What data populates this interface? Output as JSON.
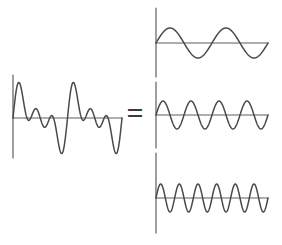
{
  "colors": {
    "background": "#ffffff",
    "wave_line": "#4a4a4a",
    "axis_line": "#5e5e5e",
    "equals": "#3c3c3c"
  },
  "equals": {
    "symbol": "="
  },
  "composite": {
    "vaxis": {
      "x1": 13,
      "y1": 75,
      "x2": 13,
      "y2": 158
    },
    "haxis": {
      "x1": 13,
      "y1": 118,
      "x2": 122,
      "y2": 118
    },
    "wave": {
      "x_start": 13,
      "x_end": 122,
      "baseline_y": 118,
      "harmonics": [
        {
          "cycles": 2,
          "amplitude_px": 15
        },
        {
          "cycles": 4,
          "amplitude_px": 14
        },
        {
          "cycles": 6,
          "amplitude_px": 14
        }
      ]
    }
  },
  "components": [
    {
      "vaxis": {
        "x1": 156,
        "y1": 8,
        "x2": 156,
        "y2": 77
      },
      "haxis": {
        "x1": 156,
        "y1": 43,
        "x2": 268,
        "y2": 43
      },
      "wave": {
        "x_start": 156,
        "x_end": 268,
        "baseline_y": 43,
        "harmonics": [
          {
            "cycles": 2,
            "amplitude_px": 15
          }
        ]
      }
    },
    {
      "vaxis": {
        "x1": 156,
        "y1": 82,
        "x2": 156,
        "y2": 148
      },
      "haxis": {
        "x1": 156,
        "y1": 115,
        "x2": 268,
        "y2": 115
      },
      "wave": {
        "x_start": 156,
        "x_end": 268,
        "baseline_y": 115,
        "harmonics": [
          {
            "cycles": 4,
            "amplitude_px": 14
          }
        ]
      }
    },
    {
      "vaxis": {
        "x1": 156,
        "y1": 153,
        "x2": 156,
        "y2": 233
      },
      "haxis": {
        "x1": 156,
        "y1": 198,
        "x2": 268,
        "y2": 198
      },
      "wave": {
        "x_start": 156,
        "x_end": 268,
        "baseline_y": 198,
        "harmonics": [
          {
            "cycles": 6,
            "amplitude_px": 14
          }
        ]
      }
    }
  ],
  "chart_data": {
    "type": "line",
    "title": "",
    "series": [
      {
        "name": "composite-waveform",
        "definition": "sum of harmonic-1, harmonic-2, harmonic-3",
        "cycles_shown": 2
      },
      {
        "name": "harmonic-1",
        "cycles_shown": 2,
        "amplitude_px": 15
      },
      {
        "name": "harmonic-2",
        "cycles_shown": 4,
        "amplitude_px": 14
      },
      {
        "name": "harmonic-3",
        "cycles_shown": 6,
        "amplitude_px": 14
      }
    ],
    "grid": false,
    "legend": false
  }
}
